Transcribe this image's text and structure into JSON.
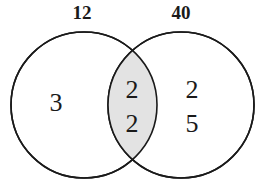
{
  "diagram": {
    "type": "venn-two-set",
    "title": "",
    "colors": {
      "stroke": "#1a1a1a",
      "circle_fill": "#ffffff",
      "intersection_fill": "#e3e3e3",
      "text": "#1a1a1a",
      "background": "#ffffff"
    },
    "geometry": {
      "left_circle": {
        "cx": 84,
        "cy": 105,
        "r": 73
      },
      "right_circle": {
        "cx": 181,
        "cy": 105,
        "r": 73
      },
      "stroke_width": 1.6
    },
    "sets": [
      {
        "id": "left",
        "label": "12",
        "label_x": 82,
        "label_y": 15
      },
      {
        "id": "right",
        "label": "40",
        "label_x": 181,
        "label_y": 15
      }
    ],
    "regions": [
      {
        "id": "left-only",
        "values": [
          "3"
        ],
        "x": 56,
        "start_y": 105
      },
      {
        "id": "intersection",
        "values": [
          "2",
          "2"
        ],
        "x": 132,
        "start_y": 92
      },
      {
        "id": "right-only",
        "values": [
          "2",
          "5"
        ],
        "x": 192,
        "start_y": 92
      }
    ],
    "line_spacing": 34
  }
}
